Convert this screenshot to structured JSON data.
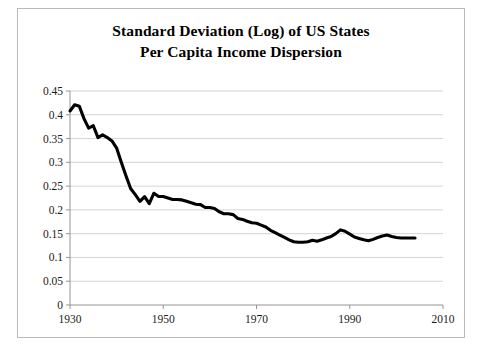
{
  "figure": {
    "border_color": "#b9b9b9",
    "background": "#ffffff"
  },
  "title": {
    "line1": "Standard Deviation (Log) of US States",
    "line2": "Per Capita Income Dispersion"
  },
  "axes": {
    "y_tick_labels": [
      "0.45",
      "0.4",
      "0.35",
      "0.3",
      "0.25",
      "0.2",
      "0.15",
      "0.1",
      "0.05",
      "0"
    ],
    "x_tick_labels": [
      "1930",
      "1950",
      "1970",
      "1990",
      "2010"
    ]
  },
  "chart_data": {
    "type": "line",
    "title": "Standard Deviation (Log) of US States Per Capita Income Dispersion",
    "xlabel": "",
    "ylabel": "",
    "xlim": [
      1930,
      2010
    ],
    "ylim": [
      0,
      0.45
    ],
    "ytick_interval": 0.05,
    "xtick_interval": 20,
    "grid": "horizontal",
    "legend": "none",
    "line_color": "#000000",
    "x": [
      1930,
      1931,
      1932,
      1933,
      1934,
      1935,
      1936,
      1937,
      1938,
      1939,
      1940,
      1941,
      1942,
      1943,
      1944,
      1945,
      1946,
      1947,
      1948,
      1949,
      1950,
      1951,
      1952,
      1953,
      1954,
      1955,
      1956,
      1957,
      1958,
      1959,
      1960,
      1961,
      1962,
      1963,
      1964,
      1965,
      1966,
      1967,
      1968,
      1969,
      1970,
      1971,
      1972,
      1973,
      1974,
      1975,
      1976,
      1977,
      1978,
      1979,
      1980,
      1981,
      1982,
      1983,
      1984,
      1985,
      1986,
      1987,
      1988,
      1989,
      1990,
      1991,
      1992,
      1993,
      1994,
      1995,
      1996,
      1997,
      1998,
      1999,
      2000,
      2001,
      2002,
      2003,
      2004
    ],
    "values": [
      0.408,
      0.421,
      0.418,
      0.392,
      0.372,
      0.377,
      0.352,
      0.358,
      0.352,
      0.345,
      0.33,
      0.3,
      0.272,
      0.245,
      0.232,
      0.218,
      0.228,
      0.213,
      0.235,
      0.228,
      0.228,
      0.225,
      0.222,
      0.222,
      0.221,
      0.218,
      0.215,
      0.212,
      0.211,
      0.205,
      0.205,
      0.203,
      0.196,
      0.192,
      0.192,
      0.19,
      0.182,
      0.18,
      0.176,
      0.173,
      0.172,
      0.168,
      0.164,
      0.157,
      0.152,
      0.147,
      0.142,
      0.137,
      0.133,
      0.132,
      0.132,
      0.133,
      0.136,
      0.134,
      0.137,
      0.141,
      0.144,
      0.15,
      0.158,
      0.155,
      0.149,
      0.143,
      0.14,
      0.137,
      0.135,
      0.138,
      0.142,
      0.145,
      0.147,
      0.144,
      0.142,
      0.141,
      0.141,
      0.141,
      0.141
    ]
  }
}
